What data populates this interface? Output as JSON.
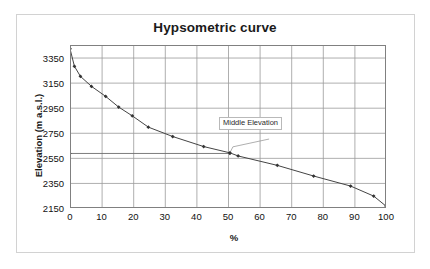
{
  "figure": {
    "title": "Hypsometric curve"
  },
  "axes": {
    "xlabel": "%",
    "ylabel": "Elevation (m a.s.l.)",
    "x_ticks": [
      "0",
      "10",
      "20",
      "30",
      "40",
      "50",
      "60",
      "70",
      "80",
      "90",
      "100"
    ],
    "y_ticks": [
      "2150",
      "2350",
      "2550",
      "2750",
      "2950",
      "3150",
      "3350"
    ]
  },
  "annotations": {
    "middle_elevation_label": "Middle Elevation"
  },
  "chart_data": {
    "type": "line",
    "title": "Hypsometric curve",
    "xlabel": "%",
    "ylabel": "Elevation (m a.s.l.)",
    "xlim": [
      0,
      100
    ],
    "ylim": [
      2150,
      3450
    ],
    "grid": true,
    "legend": false,
    "x_tick_values": [
      0,
      10,
      20,
      30,
      40,
      50,
      60,
      70,
      80,
      90,
      100
    ],
    "y_tick_values": [
      2150,
      2350,
      2550,
      2750,
      2950,
      3150,
      3350
    ],
    "series": [
      {
        "name": "Hypsometric curve",
        "marker": "diamond",
        "color": "#444444",
        "x": [
          0.0,
          1.4,
          3.3,
          6.8,
          11.3,
          15.4,
          19.7,
          24.8,
          32.5,
          42.3,
          50.6,
          53.2,
          65.6,
          77.1,
          88.8,
          96.1,
          100.0
        ],
        "y": [
          3420,
          3280,
          3200,
          3120,
          3040,
          2955,
          2885,
          2795,
          2720,
          2640,
          2590,
          2565,
          2490,
          2405,
          2325,
          2245,
          2165
        ]
      },
      {
        "name": "Middle elevation reference",
        "marker": "diamond",
        "color": "#6e6e6e",
        "x": [
          0.0,
          50.6
        ],
        "y": [
          2585,
          2585
        ]
      }
    ],
    "annotations": [
      {
        "text": "Middle Elevation",
        "x": 50.6,
        "y": 2590,
        "label_x": 63,
        "label_y": 2700
      }
    ]
  }
}
